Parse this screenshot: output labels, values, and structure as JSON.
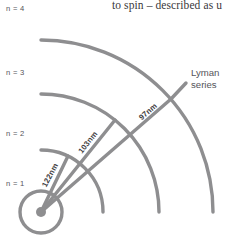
{
  "figure": {
    "kind": "bohr-model-hydrogen-lyman-series",
    "stroke_color": "#8e8e90",
    "nucleus_color": "#8e8e90",
    "text_color": "#55545a",
    "body_text_color": "#39383a",
    "background": "#ffffff"
  },
  "body_text": {
    "line": "to spin – described as u"
  },
  "shells": [
    {
      "label": "n = 4",
      "n": 4,
      "radius": 172,
      "label_x": 6,
      "label_y": 5
    },
    {
      "label": "n = 3",
      "n": 3,
      "radius": 118,
      "label_x": 6,
      "label_y": 69
    },
    {
      "label": "n = 2",
      "n": 2,
      "radius": 62,
      "label_x": 6,
      "label_y": 130
    },
    {
      "label": "n = 1",
      "n": 1,
      "radius": 21,
      "label_x": 6,
      "label_y": 180
    }
  ],
  "nucleus": {
    "cx": 41,
    "cy": 212,
    "dot_radius": 5,
    "shell_radius": 21
  },
  "transitions": [
    {
      "label": "122nm",
      "wavelength_nm": 122,
      "to_shell": 2,
      "angle_deg": -64.0,
      "label_x": 43,
      "label_y": 182,
      "label_rotate": -62
    },
    {
      "label": "103nm",
      "wavelength_nm": 103,
      "to_shell": 3,
      "angle_deg": -51.0,
      "label_x": 80,
      "label_y": 148,
      "label_rotate": -52
    },
    {
      "label": "97nm",
      "wavelength_nm": 97,
      "to_shell": 4,
      "angle_deg": -41.0,
      "label_x": 140,
      "label_y": 113,
      "label_rotate": -41
    }
  ],
  "annotation": {
    "series_name_line1": "Lyman",
    "series_name_line2": "series",
    "label_x": 190,
    "label_y": 68
  }
}
